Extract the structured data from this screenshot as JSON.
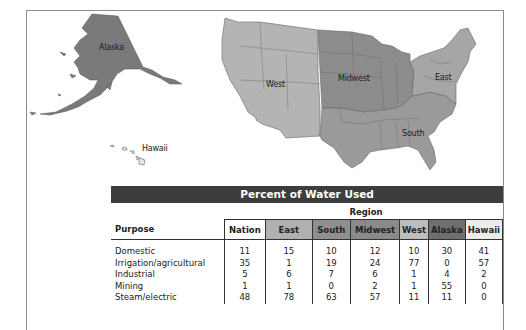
{
  "map": {
    "labels": {
      "alaska": "Alaska",
      "hawaii": "Hawaii",
      "west": "West",
      "midwest": "Midwest",
      "east": "East",
      "south": "South"
    },
    "colors": {
      "west": "#b4b4b4",
      "midwest": "#8c8c8c",
      "south": "#9a9a9a",
      "east": "#a6a6a6",
      "alaska": "#7a7a7a",
      "hawaii": "#e8e8e8"
    }
  },
  "table": {
    "title": "Percent of Water Used",
    "region_label": "Region",
    "headers": {
      "purpose": "Purpose",
      "nation": "Nation",
      "east": "East",
      "south": "South",
      "midwest": "Midwest",
      "west": "West",
      "alaska": "Alaska",
      "hawaii": "Hawaii"
    },
    "header_colors": {
      "nation": "#ffffff",
      "east": "#b0b0b0",
      "south": "#8f8f8f",
      "midwest": "#8a8a8a",
      "west": "#bdbdbd",
      "alaska": "#6f6f6f",
      "hawaii": "#ececec"
    },
    "rows": [
      {
        "purpose": "Domestic",
        "nation": "11",
        "east": "15",
        "south": "10",
        "midwest": "12",
        "west": "10",
        "alaska": "30",
        "hawaii": "41"
      },
      {
        "purpose": "Irrigation/agricultural",
        "nation": "35",
        "east": "1",
        "south": "19",
        "midwest": "24",
        "west": "77",
        "alaska": "0",
        "hawaii": "57"
      },
      {
        "purpose": "Industrial",
        "nation": "5",
        "east": "6",
        "south": "7",
        "midwest": "6",
        "west": "1",
        "alaska": "4",
        "hawaii": "2"
      },
      {
        "purpose": "Mining",
        "nation": "1",
        "east": "1",
        "south": "0",
        "midwest": "2",
        "west": "1",
        "alaska": "55",
        "hawaii": "0"
      },
      {
        "purpose": "Steam/electric",
        "nation": "48",
        "east": "78",
        "south": "63",
        "midwest": "57",
        "west": "11",
        "alaska": "11",
        "hawaii": "0"
      }
    ]
  }
}
